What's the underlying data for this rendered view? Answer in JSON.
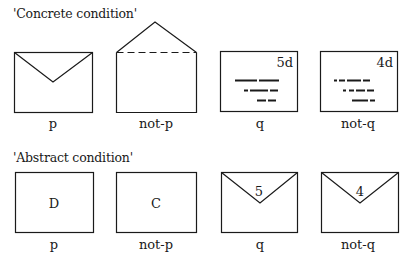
{
  "concrete": {
    "title": "'Concrete condition'",
    "cards": [
      {
        "id": "p",
        "label": "p",
        "type": "envelope-closed-sealed"
      },
      {
        "id": "not-p",
        "label": "not-p",
        "type": "envelope-open-flap"
      },
      {
        "id": "q",
        "label": "q",
        "type": "envelope-front-stamp",
        "stamp": "5d"
      },
      {
        "id": "not-q",
        "label": "not-q",
        "type": "envelope-front-stamp",
        "stamp": "4d"
      }
    ]
  },
  "abstract": {
    "title": "'Abstract condition'",
    "cards": [
      {
        "id": "p",
        "label": "p",
        "type": "card-letter",
        "symbol": "D"
      },
      {
        "id": "not-p",
        "label": "not-p",
        "type": "card-letter",
        "symbol": "C"
      },
      {
        "id": "q",
        "label": "q",
        "type": "envelope-number",
        "symbol": "5"
      },
      {
        "id": "not-q",
        "label": "not-q",
        "type": "envelope-number",
        "symbol": "4"
      }
    ]
  },
  "colors": {
    "ink": "#1a1a1a",
    "background": "#ffffff"
  }
}
